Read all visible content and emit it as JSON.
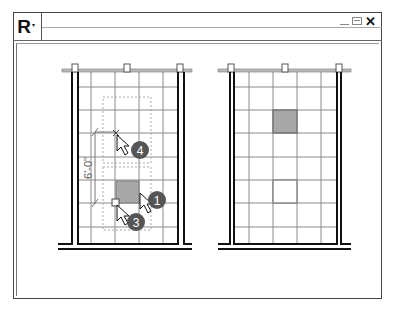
{
  "window": {
    "app_button_letter": "R",
    "app_button_caret": "▾",
    "controls": {
      "minimize_icon": "minimize-icon",
      "maximize_icon": "maximize-icon",
      "close_label": "✕"
    }
  },
  "drawing": {
    "dimension_label": "6'-0\"",
    "left_panel": {
      "description": "ceiling grid with tile being moved",
      "callouts": [
        {
          "number": "4",
          "cx": 140,
          "cy": 150
        },
        {
          "number": "1",
          "cx": 157,
          "cy": 200
        },
        {
          "number": "3",
          "cx": 136,
          "cy": 222
        }
      ]
    },
    "right_panel": {
      "description": "ceiling grid with tile relocated"
    },
    "colors": {
      "tile_fill": "#a8a8a8",
      "grid_line": "#888888",
      "wall": "#111111",
      "callout_badge": "#555555"
    }
  }
}
